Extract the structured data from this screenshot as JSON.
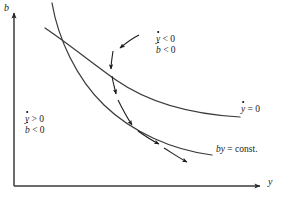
{
  "figure": {
    "type": "phase-diagram",
    "background": "#ffffff",
    "ink_color": "#262626",
    "axes": {
      "x_label": "y",
      "y_label": "b",
      "x_axis": {
        "x0": 14,
        "y0": 186,
        "x1": 262,
        "y1": 186,
        "arrow": "right"
      },
      "y_axis": {
        "x0": 14,
        "y0": 186,
        "x1": 14,
        "y1": 11,
        "arrow": "up"
      }
    },
    "curves": [
      {
        "name": "ydot-nullcline",
        "label": "y = 0",
        "label_base": "y",
        "label_rhs": "= 0",
        "label_pos": {
          "x": 243,
          "y": 110
        },
        "description": "upper decreasing convex curve, flattens to the right"
      },
      {
        "name": "by-constant-curve",
        "label": "by = const.",
        "label_italic": "by",
        "label_roman": "= const.",
        "label_pos": {
          "x": 218,
          "y": 150
        },
        "description": "steeper hyperbola-like curve crossing the nullcline near the top-left"
      }
    ],
    "region_labels": [
      {
        "name": "upper-right-region",
        "pos": {
          "x": 158,
          "y": 40
        },
        "lines": [
          {
            "base": "y",
            "dot": true,
            "rel": "< 0"
          },
          {
            "base": "b",
            "dot": true,
            "rel": "< 0"
          }
        ]
      },
      {
        "name": "lower-left-region",
        "pos": {
          "x": 27,
          "y": 120
        },
        "lines": [
          {
            "base": "y",
            "dot": true,
            "rel": "> 0"
          },
          {
            "base": "b",
            "dot": true,
            "rel": "< 0"
          }
        ]
      }
    ],
    "arrows": [
      {
        "name": "pointer-arrow",
        "style": "solid",
        "from": {
          "x": 138,
          "y": 36
        },
        "to": {
          "x": 118,
          "y": 49
        }
      },
      {
        "name": "trajectory-arrow-1",
        "style": "dashed",
        "from": {
          "x": 113,
          "y": 52
        },
        "to": {
          "x": 111,
          "y": 70
        }
      },
      {
        "name": "trajectory-arrow-2",
        "style": "dashed",
        "from": {
          "x": 112,
          "y": 76
        },
        "to": {
          "x": 116,
          "y": 95
        }
      },
      {
        "name": "trajectory-arrow-3",
        "style": "dashed",
        "from": {
          "x": 118,
          "y": 99
        },
        "to": {
          "x": 133,
          "y": 126
        }
      },
      {
        "name": "trajectory-arrow-4",
        "style": "dashed",
        "from": {
          "x": 138,
          "y": 131
        },
        "to": {
          "x": 160,
          "y": 145
        }
      },
      {
        "name": "trajectory-arrow-5",
        "style": "dashed",
        "from": {
          "x": 164,
          "y": 148
        },
        "to": {
          "x": 188,
          "y": 163
        }
      }
    ]
  }
}
